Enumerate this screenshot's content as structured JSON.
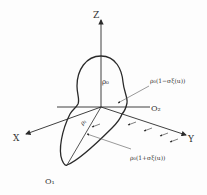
{
  "diagram": {
    "axes": {
      "z_label": "Z",
      "x_label": "X",
      "y_label": "Y"
    },
    "points": {
      "o1": "O₁",
      "o2": "O₂"
    },
    "annotations": {
      "rho_center": "ρ₀",
      "rho_origin": "ρ₁",
      "upper_formula": "ρ₀(1−σξ(u))",
      "lower_formula": "ρ₀(1+σξ(u))"
    },
    "colors": {
      "ink": "#2a2a2a",
      "background": "#fdfdfd"
    }
  }
}
